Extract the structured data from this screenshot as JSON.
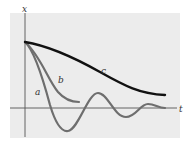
{
  "diagram": {
    "axes": {
      "x_axis_label": "t",
      "y_axis_label": "x"
    },
    "curves": [
      {
        "id": "a",
        "label": "a",
        "description": "underdamped oscillation",
        "color": "#6e6e6e"
      },
      {
        "id": "b",
        "label": "b",
        "description": "critically damped",
        "color": "#6e6e6e"
      },
      {
        "id": "c",
        "label": "c",
        "description": "overdamped",
        "color": "#111111"
      }
    ],
    "colors": {
      "panel_background": "#ececec",
      "axis": "#555555"
    }
  }
}
